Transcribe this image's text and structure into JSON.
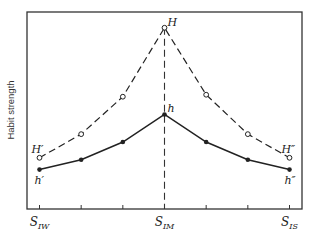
{
  "chart_data": {
    "type": "line",
    "title": "",
    "xlabel": "",
    "ylabel": "Habit strength",
    "x": [
      0,
      1,
      2,
      3,
      4,
      5,
      6
    ],
    "tick_labels": [
      {
        "x": 0,
        "base": "S",
        "sub": "IW"
      },
      {
        "x": 3,
        "base": "S",
        "sub": "IM"
      },
      {
        "x": 6,
        "base": "S",
        "sub": "IS"
      }
    ],
    "xlim": [
      -0.3,
      6.3
    ],
    "ylim": [
      0,
      10
    ],
    "grid": false,
    "reference_line": {
      "x": 3,
      "style": "dashed"
    },
    "series": [
      {
        "name": "H",
        "style": "dashed",
        "marker": "open-circle",
        "values": [
          2.6,
          3.8,
          5.7,
          9.2,
          5.8,
          3.8,
          2.6
        ],
        "point_labels": [
          {
            "index": 0,
            "text": "H′",
            "position": "above-left"
          },
          {
            "index": 3,
            "text": "H",
            "position": "right"
          },
          {
            "index": 6,
            "text": "H″",
            "position": "above-left"
          }
        ]
      },
      {
        "name": "h",
        "style": "solid",
        "marker": "filled-circle",
        "values": [
          2.0,
          2.5,
          3.4,
          4.8,
          3.4,
          2.5,
          2.0
        ],
        "point_labels": [
          {
            "index": 0,
            "text": "h′",
            "position": "below"
          },
          {
            "index": 3,
            "text": "h",
            "position": "above-right"
          },
          {
            "index": 6,
            "text": "h″",
            "position": "below"
          }
        ]
      }
    ]
  }
}
